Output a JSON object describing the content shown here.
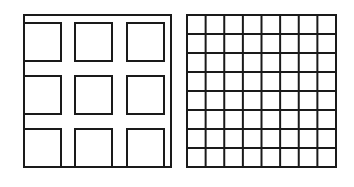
{
  "figure": {
    "width": 354,
    "height": 187,
    "background": "#ffffff",
    "stroke_color": "#1a1a1a",
    "stroke_width": 2
  },
  "left_panel": {
    "description": "3x3 grid of separated squares inside an open frame",
    "frame": {
      "x1": 24,
      "y1": 15,
      "x2": 171,
      "y2": 167
    },
    "rows": 3,
    "cols": 3,
    "col_ranges": [
      [
        24,
        61
      ],
      [
        75,
        112
      ],
      [
        127,
        164
      ]
    ],
    "row_ranges": [
      [
        23,
        61
      ],
      [
        76,
        114
      ],
      [
        129,
        167
      ]
    ]
  },
  "right_panel": {
    "description": "8x8 uniform square grid",
    "x": 187,
    "y": 15,
    "width": 149,
    "height": 152,
    "rows": 8,
    "cols": 8
  }
}
